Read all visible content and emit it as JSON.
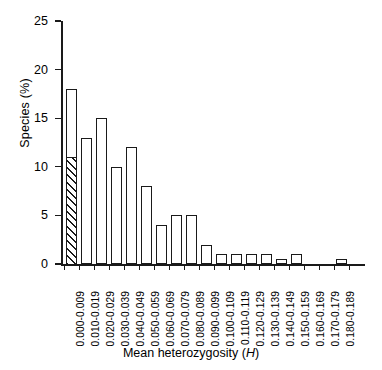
{
  "chart_data": {
    "type": "bar",
    "title": "",
    "xlabel": "Mean heterozygosity (H)",
    "xlabel_plain": "Mean heterozygosity",
    "xlabel_symbol": "H",
    "ylabel": "Species (%)",
    "ylim": [
      0,
      25
    ],
    "yticks": [
      0,
      5,
      10,
      15,
      20,
      25
    ],
    "ytick_labels": [
      "0",
      "5",
      "10",
      "15",
      "20",
      "25"
    ],
    "grid": false,
    "legend": "none",
    "categories": [
      "0.000-0.009",
      "0.010-0.019",
      "0.020-0.029",
      "0.030-0.039",
      "0.040-0.049",
      "0.050-0.059",
      "0.060-0.069",
      "0.070-0.079",
      "0.080-0.089",
      "0.090-0.099",
      "0.100-0.109",
      "0.110-0.119",
      "0.120-0.129",
      "0.130-0.139",
      "0.140-0.149",
      "0.150-0.159",
      "0.160-0.169",
      "0.170-0.179",
      "0.180-0.189"
    ],
    "values": [
      18,
      13,
      15,
      10,
      12,
      8,
      4,
      5,
      5,
      2,
      1,
      1,
      1,
      1,
      0.5,
      1,
      0,
      0,
      0.5
    ],
    "series": [
      {
        "name": "Species (%)",
        "values": [
          18,
          13,
          15,
          10,
          12,
          8,
          4,
          5,
          5,
          2,
          1,
          1,
          1,
          1,
          0.5,
          1,
          0,
          0,
          0.5
        ],
        "fill": "open",
        "edge_color": "#1a1a1a",
        "face_color": "#ffffff"
      },
      {
        "name": "Hatched subset (first bin)",
        "values": [
          11,
          0,
          0,
          0,
          0,
          0,
          0,
          0,
          0,
          0,
          0,
          0,
          0,
          0,
          0,
          0,
          0,
          0,
          0
        ],
        "fill": "diagonal-hatch",
        "edge_color": "#1a1a1a",
        "hatch_angle_deg": 45
      }
    ],
    "annotations": []
  },
  "axes": {
    "y_title": "Species (%)",
    "x_title_prefix": "Mean heterozygosity (",
    "x_title_symbol": "H",
    "x_title_suffix": ")"
  }
}
